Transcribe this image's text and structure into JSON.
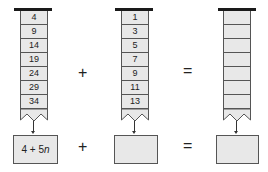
{
  "columns": [
    {
      "id": "sequence-a",
      "cells": [
        "4",
        "9",
        "14",
        "19",
        "24",
        "29",
        "34"
      ],
      "formula": "4 + 5n"
    },
    {
      "id": "sequence-b",
      "cells": [
        "1",
        "3",
        "5",
        "7",
        "9",
        "11",
        "13"
      ],
      "formula": ""
    },
    {
      "id": "sequence-sum",
      "cells": [
        "",
        "",
        "",
        "",
        "",
        "",
        ""
      ],
      "formula": ""
    }
  ],
  "operators": {
    "plus_top": "+",
    "equals_top": "=",
    "plus_bottom": "+",
    "equals_bottom": "="
  },
  "colors": {
    "cell_fill": "#e8e8e8",
    "border": "#555555",
    "bar": "#1a1a1a"
  }
}
